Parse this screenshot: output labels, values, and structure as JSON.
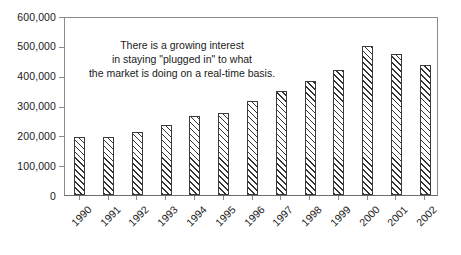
{
  "chart_data": {
    "type": "bar",
    "title": "",
    "subtitle": "",
    "xlabel": "",
    "ylabel": "",
    "categories": [
      "1990",
      "1991",
      "1992",
      "1993",
      "1994",
      "1995",
      "1996",
      "1997",
      "1998",
      "1999",
      "2000",
      "2001",
      "2002"
    ],
    "values": [
      195000,
      193000,
      210000,
      235000,
      265000,
      275000,
      315000,
      350000,
      383000,
      418000,
      500000,
      472000,
      437000
    ],
    "ylim": [
      0,
      600000
    ],
    "ytick_values": [
      0,
      100000,
      200000,
      300000,
      400000,
      500000,
      600000
    ],
    "ytick_labels": [
      "0",
      "100,000",
      "200,000",
      "300,000",
      "400,000",
      "500,000",
      "600,000"
    ],
    "grid": false,
    "legend": null,
    "legend_position": "none",
    "bar_fill": "diagonal-hatch",
    "bar_edge_color": "#3a3a3a",
    "axis_color": "#8a8a8a",
    "text_color": "#1a1a1a",
    "annotations": [
      {
        "name": "growth-note",
        "lines": [
          "There is a growing interest",
          "in staying \"plugged in\" to what",
          "the market is doing on a real-time basis."
        ]
      }
    ]
  }
}
